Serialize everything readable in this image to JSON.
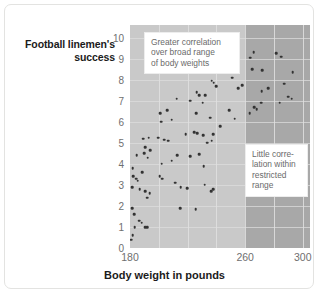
{
  "figure": {
    "y_axis_title": "Football linemen's success",
    "x_axis_title": "Body weight in pounds",
    "annotations": [
      {
        "name": "broad-range",
        "lines": [
          "Greater correlation",
          "over broad range",
          "of body weights"
        ]
      },
      {
        "name": "restricted-range",
        "lines": [
          "Little corre-",
          "lation within",
          "restricted",
          "range"
        ]
      }
    ],
    "colors": {
      "band_light": "#c9c9c9",
      "band_dark": "#a8a8a8",
      "point": "#333333",
      "gridline": "#dcdcdc",
      "tick_text": "#6f6f6f",
      "axis_title_text": "#1b1b1b",
      "annotation_text": "#6a6a6a",
      "card_border": "#e3e3e1",
      "background": "#ffffff"
    }
  },
  "chart_data": {
    "type": "scatter",
    "title": "",
    "xlabel": "Body weight in pounds",
    "ylabel": "Football linemen's success",
    "xlim": [
      180,
      305
    ],
    "ylim": [
      0,
      10.6
    ],
    "xticks": [
      180,
      260,
      300
    ],
    "yticks": [
      0,
      1,
      2,
      3,
      4,
      5,
      6,
      7,
      8,
      9,
      10
    ],
    "xtick_labels": [
      "180",
      "260",
      "300"
    ],
    "ytick_labels": [
      "0",
      "1",
      "2",
      "3",
      "4",
      "5",
      "6",
      "7",
      "8",
      "9",
      "10"
    ],
    "grid": true,
    "legend": null,
    "shaded_regions": [
      {
        "name": "broad-range-band",
        "x_from": 180,
        "x_to": 260,
        "color": "#c9c9c9"
      },
      {
        "name": "restricted-range-band",
        "x_from": 260,
        "x_to": 305,
        "color": "#a8a8a8"
      }
    ],
    "annotations": [
      {
        "text": "Greater correlation over broad range of body weights",
        "x": 196,
        "y": 10.0
      },
      {
        "text": "Little correlation within restricted range",
        "x": 276,
        "y": 5.2
      }
    ],
    "series": [
      {
        "name": "Football linemen",
        "marker": "circle",
        "color": "#333333",
        "points": [
          [
            181.0,
            0.4
          ],
          [
            182.0,
            0.6
          ],
          [
            183.4,
            1.0
          ],
          [
            183.0,
            1.6
          ],
          [
            181.6,
            1.9
          ],
          [
            186.5,
            1.3
          ],
          [
            188.0,
            1.2
          ],
          [
            190.5,
            1.0
          ],
          [
            192.0,
            1.0
          ],
          [
            215.0,
            1.9
          ],
          [
            225.5,
            1.85
          ],
          [
            181.4,
            2.9
          ],
          [
            182.2,
            3.4
          ],
          [
            181.8,
            3.8
          ],
          [
            184.2,
            3.3
          ],
          [
            185.4,
            3.2
          ],
          [
            186.8,
            2.8
          ],
          [
            188.6,
            3.6
          ],
          [
            190.6,
            2.7
          ],
          [
            192.0,
            2.4
          ],
          [
            193.6,
            2.6
          ],
          [
            200.6,
            3.4
          ],
          [
            202.2,
            3.3
          ],
          [
            211.4,
            3.1
          ],
          [
            215.2,
            2.9
          ],
          [
            219.6,
            2.85
          ],
          [
            231.8,
            3.0
          ],
          [
            236.4,
            2.7
          ],
          [
            237.6,
            2.8
          ],
          [
            184.6,
            4.4
          ],
          [
            190.0,
            4.5
          ],
          [
            192.2,
            4.3
          ],
          [
            194.0,
            4.65
          ],
          [
            202.0,
            4.0
          ],
          [
            209.0,
            4.15
          ],
          [
            212.6,
            4.4
          ],
          [
            222.0,
            4.35
          ],
          [
            228.2,
            4.45
          ],
          [
            231.2,
            3.9
          ],
          [
            189.0,
            5.2
          ],
          [
            190.4,
            4.8
          ],
          [
            193.0,
            5.25
          ],
          [
            199.4,
            5.25
          ],
          [
            203.6,
            5.15
          ],
          [
            206.4,
            5.1
          ],
          [
            218.6,
            5.4
          ],
          [
            224.6,
            5.5
          ],
          [
            226.6,
            5.45
          ],
          [
            231.0,
            5.35
          ],
          [
            233.6,
            5.0
          ],
          [
            236.6,
            5.1
          ],
          [
            237.8,
            5.4
          ],
          [
            200.8,
            6.4
          ],
          [
            201.6,
            6.0
          ],
          [
            206.0,
            6.55
          ],
          [
            209.0,
            6.1
          ],
          [
            226.0,
            6.4
          ],
          [
            235.6,
            6.2
          ],
          [
            242.6,
            5.8
          ],
          [
            249.0,
            6.55
          ],
          [
            252.6,
            6.15
          ],
          [
            263.0,
            6.4
          ],
          [
            266.4,
            6.7
          ],
          [
            268.0,
            6.6
          ],
          [
            271.0,
            6.9
          ],
          [
            284.0,
            6.9
          ],
          [
            290.0,
            7.2
          ],
          [
            292.4,
            7.1
          ],
          [
            212.4,
            7.1
          ],
          [
            222.0,
            7.0
          ],
          [
            226.2,
            7.4
          ],
          [
            228.0,
            7.25
          ],
          [
            230.6,
            6.9
          ],
          [
            232.2,
            7.25
          ],
          [
            255.2,
            7.6
          ],
          [
            258.0,
            7.75
          ],
          [
            271.4,
            7.45
          ],
          [
            276.0,
            7.6
          ],
          [
            287.0,
            7.8
          ],
          [
            236.8,
            7.95
          ],
          [
            238.0,
            7.85
          ],
          [
            240.0,
            7.7
          ],
          [
            251.0,
            8.1
          ],
          [
            265.0,
            8.5
          ],
          [
            272.0,
            8.45
          ],
          [
            293.0,
            8.35
          ],
          [
            263.4,
            9.05
          ],
          [
            266.0,
            9.3
          ],
          [
            281.4,
            9.25
          ],
          [
            285.0,
            9.1
          ]
        ]
      }
    ]
  }
}
